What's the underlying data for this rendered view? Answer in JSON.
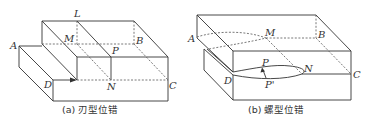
{
  "figure": {
    "panels": [
      {
        "id": "a",
        "caption": "(a) 刃型位错",
        "labels": {
          "L": "L",
          "M": "M",
          "A": "A",
          "B": "B",
          "P": "P",
          "D": "D",
          "N": "N",
          "C": "C"
        }
      },
      {
        "id": "b",
        "caption": "(b) 螺型位错",
        "labels": {
          "A": "A",
          "M": "M",
          "B": "B",
          "P": "P",
          "N": "N",
          "D": "D",
          "P2": "P'",
          "C": "C"
        }
      }
    ],
    "colors": {
      "line": "#333333",
      "background": "#ffffff"
    }
  }
}
